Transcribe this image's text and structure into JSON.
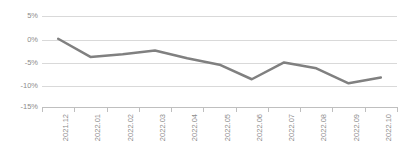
{
  "chart_data": {
    "type": "line",
    "title": "",
    "xlabel": "",
    "ylabel": "",
    "categories": [
      "2021.12",
      "2022.01",
      "2022.02",
      "2022.03",
      "2022.04",
      "2022.05",
      "2022.06",
      "2022.07",
      "2022.08",
      "2022.09",
      "2022.10"
    ],
    "series": [
      {
        "name": "series-1",
        "values": [
          0.0,
          -4.0,
          -3.4,
          -2.6,
          -4.3,
          -5.7,
          -8.9,
          -5.2,
          -6.5,
          -9.8,
          -8.5
        ]
      }
    ],
    "yticks": [
      5,
      0,
      -5,
      -10,
      -15
    ],
    "ytick_labels": [
      "5%",
      "0%",
      "-5%",
      "-10%",
      "-15%"
    ],
    "ylim": [
      -15,
      5
    ],
    "grid": true,
    "legend": false,
    "legend_position": "none",
    "unit": "%"
  },
  "style": {
    "line_color": "#808080",
    "grid_color": "#d9d9d9",
    "axis_color": "#bfbfbf",
    "label_color": "#8c8c8c",
    "background": "#ffffff",
    "line_width": 2.5
  }
}
